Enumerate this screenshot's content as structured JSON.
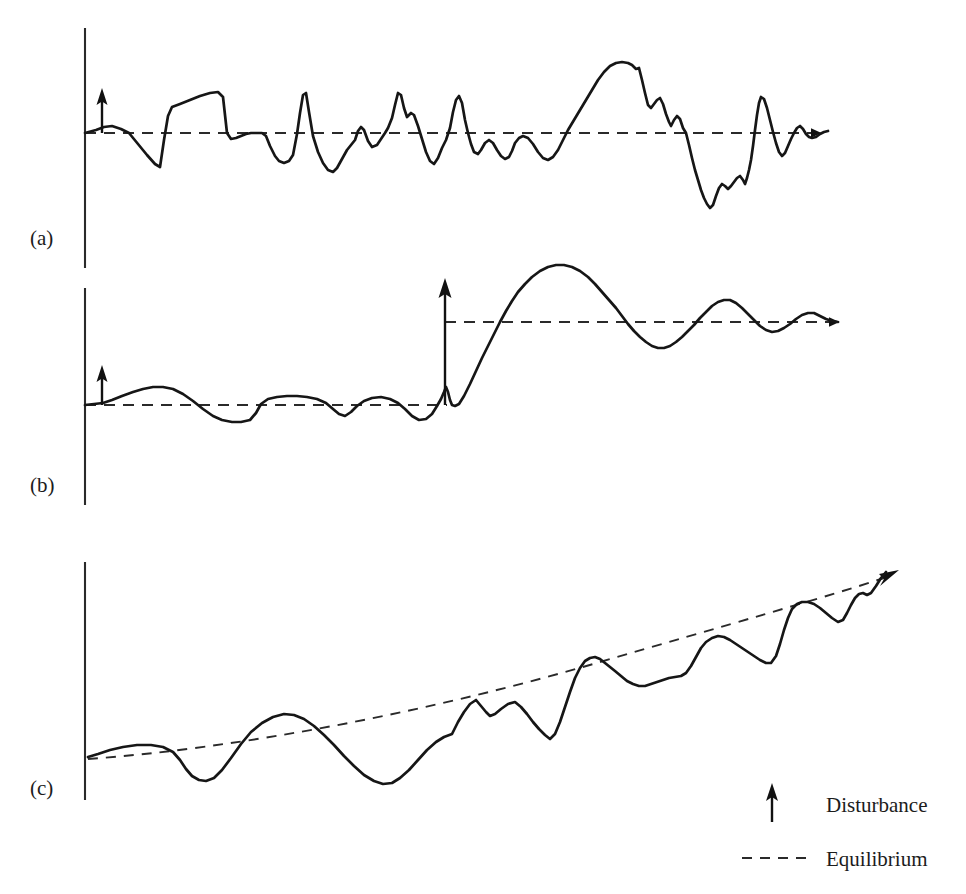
{
  "figure": {
    "width": 966,
    "height": 894,
    "background": "#ffffff",
    "line_color": "#161616",
    "axis_color": "#2a2a2a",
    "dash_color": "#2a2a2a"
  },
  "panels": [
    {
      "id": "a",
      "label": "(a)",
      "label_x": 30,
      "label_y": 245,
      "description": "Stable system: repeated small disturbances, fluctuations around a constant equilibrium",
      "axis": {
        "x": 85,
        "y_top": 28,
        "y_bottom": 268
      },
      "equilibrium": {
        "y": 133,
        "x_start": 85,
        "x_end": 812,
        "arrow_tip_x": 838
      },
      "disturbances": [
        {
          "x": 102,
          "y_base": 133,
          "y_tip": 93
        }
      ]
    },
    {
      "id": "b",
      "label": "(b)",
      "label_x": 30,
      "label_y": 492,
      "description": "Regime shift: a large disturbance moves the system to a new, higher equilibrium",
      "axis": {
        "x": 85,
        "y_top": 288,
        "y_bottom": 505
      },
      "equilibrium_low": {
        "y": 405,
        "x_start": 85,
        "x_end": 447
      },
      "equilibrium_high": {
        "y": 322,
        "x_start": 445,
        "x_end": 828,
        "arrow_tip_x": 856
      },
      "disturbances": [
        {
          "x": 102,
          "y_base": 405,
          "y_tip": 368
        },
        {
          "x": 445,
          "y_base": 405,
          "y_tip": 281
        }
      ]
    },
    {
      "id": "c",
      "label": "(c)",
      "label_x": 30,
      "label_y": 795,
      "description": "Directional change: fluctuations around a steadily rising equilibrium trend",
      "axis": {
        "x": 85,
        "y_top": 562,
        "y_bottom": 800
      },
      "equilibrium_trend": {
        "x_start": 90,
        "y_start": 758,
        "x_end": 888,
        "y_end": 578,
        "curved": true,
        "arrow_tip_x": 900,
        "arrow_tip_y": 570
      },
      "disturbances": []
    }
  ],
  "legend": {
    "x": 760,
    "items": [
      {
        "key": "disturbance",
        "label": "Disturbance",
        "symbol": "up-arrow",
        "symbol_x": 772,
        "symbol_y_base": 822,
        "symbol_y_tip": 788,
        "label_x": 826,
        "label_y": 812
      },
      {
        "key": "equilibrium",
        "label": "Equilibrium",
        "symbol": "dashed-line",
        "symbol_x_start": 742,
        "symbol_x_end": 812,
        "symbol_y": 858,
        "label_x": 826,
        "label_y": 866
      }
    ]
  },
  "chart_data": {
    "type": "line",
    "xlabel": "Time",
    "ylabel": "Ecosystem state",
    "grid": false,
    "legend_position": "bottom-right",
    "legend_entries": [
      "Disturbance",
      "Equilibrium"
    ],
    "series": [
      {
        "name": "panel-a-state",
        "panel": "a",
        "equilibrium_y": 133,
        "points": "85,133 96,130 104,127 112,126 121,129 129,133 138,144 147,155 155,164 160,167 164,140 168,116 172,107 180,104 190,100 200,96 210,93 218,92 223,97 227,133 231,139 236,138 241,136 246,134 251,133 256,133 262,133 266,136 270,146 275,156 279,161 284,163 289,161 293,155 297,134 300,113 303,95 306,93 309,112 313,136 318,152 323,163 328,170 333,172 337,168 342,159 347,150 351,145 355,140 358,131 361,127 364,130 368,141 372,147 377,145 381,139 385,133 388,128 392,118 395,105 398,93 401,95 404,108 407,117 411,113 414,115 418,126 422,139 426,152 430,161 434,164 438,158 442,148 446,140 450,128 453,112 456,100 459,96 462,103 465,120 468,133 471,144 474,152 478,154 481,150 485,143 489,140 493,143 497,150 501,156 505,159 509,157 512,151 515,143 519,138 523,136 528,138 533,144 538,152 543,158 548,160 553,157 558,150 563,140 568,130 574,120 580,110 586,100 592,90 598,80 604,72 610,66 616,63 622,62 628,63 632,65 636,69 639,68 642,80 645,93 648,105 651,108 654,104 657,100 660,98 663,104 666,114 669,122 671,126 674,120 677,116 680,119 683,128 686,133 689,145 692,158 695,170 698,180 701,190 704,198 707,204 710,208 713,205 716,196 719,188 722,184 725,186 728,189 731,186 734,182 737,178 740,176 743,180 745,184 747,178 749,170 751,160 753,146 755,130 757,115 759,103 761,97 764,99 767,108 770,120 773,132 776,143 779,152 782,156 785,153 788,146 791,139 794,133 797,128 800,126 803,129 806,134 809,137 812,138 816,137 820,134 824,132 828,131"
      },
      {
        "name": "panel-b-state",
        "panel": "b",
        "equilibrium_low_y": 405,
        "equilibrium_high_y": 322,
        "points": "85,405 94,404 103,403 112,400 122,396 133,392 143,389 153,387 163,387 173,389 183,394 193,401 203,409 213,416 222,420 232,422 241,422 250,420 256,413 261,404 268,399 277,397 287,396 297,396 307,397 317,399 326,403 333,409 339,414 345,416 351,412 357,406 364,401 372,398 381,397 390,399 398,403 405,409 412,416 419,420 426,419 432,414 437,406 441,399 444,392 446,387 448,392 450,400 452,405 455,406 459,404 464,396 470,384 476,371 482,358 488,346 494,334 500,322 506,311 512,301 518,292 525,284 532,277 540,271 548,267 556,265 564,265 572,267 580,271 588,277 595,284 602,292 609,300 616,308 622,316 628,324 634,331 640,337 646,342 652,346 658,348 664,348 670,346 676,342 682,337 688,331 694,325 700,318 706,312 712,306 718,302 724,300 730,300 736,303 742,308 748,314 754,320 760,326 766,330 772,332 778,331 784,328 790,324 796,319 802,315 808,313 814,313 820,316 826,319 832,321 838,322"
      },
      {
        "name": "panel-c-state",
        "panel": "c",
        "trend": "rising",
        "points": "88,757 98,754 110,750 123,747 137,745 151,745 163,747 173,752 180,760 186,769 192,776 199,780 206,781 214,778 222,770 231,758 241,744 251,732 262,723 273,717 284,714 294,715 304,719 314,726 324,735 334,745 344,756 354,766 364,775 374,781 383,784 392,783 400,778 409,770 418,760 427,750 436,742 444,737 452,734 458,722 464,712 470,704 476,700 481,706 486,712 490,716 495,714 501,709 508,704 515,702 521,707 527,714 533,722 539,729 545,735 550,739 555,734 560,722 565,707 570,692 575,678 580,668 585,661 590,658 595,657 600,659 605,663 610,667 615,671 621,676 627,681 633,684 639,686 645,686 651,684 657,682 663,680 669,678 675,677 681,676 686,673 691,666 696,657 701,648 706,642 712,638 718,636 724,637 730,640 736,644 742,648 748,652 754,656 760,660 766,663 771,663 776,656 780,644 784,630 788,618 792,609 797,604 802,602 808,602 814,604 820,608 826,613 832,618 838,622 843,620 847,613 851,605 855,598 859,594 863,593 867,595 871,593 876,586 881,578 886,572"
      }
    ],
    "annotations": [
      {
        "panel": "a",
        "type": "disturbance-arrow",
        "x": 102,
        "magnitude": "small"
      },
      {
        "panel": "b",
        "type": "disturbance-arrow",
        "x": 102,
        "magnitude": "small"
      },
      {
        "panel": "b",
        "type": "disturbance-arrow",
        "x": 445,
        "magnitude": "large"
      }
    ]
  }
}
